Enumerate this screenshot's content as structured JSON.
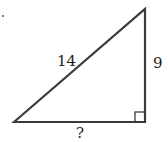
{
  "diagram": {
    "type": "right-triangle",
    "hypotenuse_label": "14",
    "vertical_leg_label": "9",
    "horizontal_leg_label": "?",
    "right_angle_marker": "bottom-right",
    "stroke_color": "#3a3a3a"
  }
}
